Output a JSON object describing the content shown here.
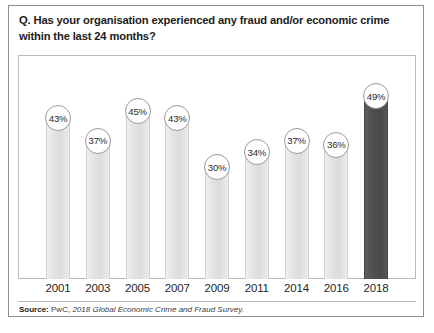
{
  "card": {
    "question": "Q. Has your organisation experienced any fraud and/or economic crime within the last 24 months?"
  },
  "source": {
    "label": "Source:",
    "publisher": "PwC,",
    "title": "2018 Global Economic Crime and Fraud Survey."
  },
  "colors": {
    "bar_light": "#e4e4e4",
    "bar_highlight": "#4f4f4f",
    "frame": "#b9b9b9",
    "card_border": "#8d8d8d",
    "text": "#1b1b1b"
  },
  "chart_data": {
    "type": "bar",
    "title": "Q. Has your organisation experienced any fraud and/or economic crime within the last 24 months?",
    "xlabel": "",
    "ylabel": "",
    "ylim": [
      0,
      60
    ],
    "grid": false,
    "legend": "none",
    "categories": [
      "2001",
      "2003",
      "2005",
      "2007",
      "2009",
      "2011",
      "2014",
      "2016",
      "2018"
    ],
    "values": [
      43,
      37,
      45,
      43,
      30,
      34,
      37,
      36,
      49
    ],
    "value_labels": [
      "43%",
      "37%",
      "45%",
      "43%",
      "30%",
      "34%",
      "37%",
      "36%",
      "49%"
    ],
    "highlight_index": 8,
    "annotations": "Each bar is topped by a white circular bubble containing the percentage value."
  }
}
